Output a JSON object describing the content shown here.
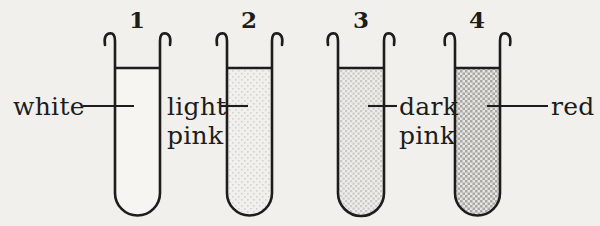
{
  "figure": {
    "colors": {
      "background": "#f1f0ec",
      "ink": "#1d1d1b",
      "tube1_liquid": "#f6f5f1",
      "tube2_liquid_avg": "#ededea",
      "tube3_liquid_avg": "#e3e2de",
      "tube4_liquid_avg": "#d2d1cd"
    },
    "tubes": [
      {
        "number": "1",
        "label_lines": [
          "white"
        ],
        "fill_style": "empty-white"
      },
      {
        "number": "2",
        "label_lines": [
          "light",
          "pink"
        ],
        "fill_style": "light-stipple"
      },
      {
        "number": "3",
        "label_lines": [
          "dark",
          "pink"
        ],
        "fill_style": "medium-stipple"
      },
      {
        "number": "4",
        "label_lines": [
          "red"
        ],
        "fill_style": "dark-crosshatch"
      }
    ]
  }
}
